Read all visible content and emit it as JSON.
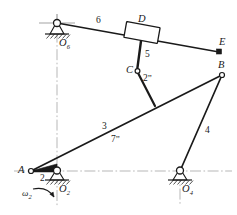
{
  "figure": {
    "type": "kinematic-linkage-diagram",
    "stroke_color": "#1a1a1a",
    "centerline_color": "#8a8a8a",
    "joint_labels": {
      "A": "A",
      "B": "B",
      "C": "C",
      "D": "D",
      "E": "E",
      "O2_letter": "O",
      "O2_sub": "2",
      "O4_letter": "O",
      "O4_sub": "4",
      "O6_letter": "O",
      "O6_sub": "6"
    },
    "link_labels": {
      "link2": "2",
      "link3": "3",
      "link4": "4",
      "link5": "5",
      "link6": "6",
      "link2pp_num": "2",
      "link2pp_prime": "”",
      "link7pp_num": "7",
      "link7pp_prime": "”"
    },
    "motion": {
      "omega_symbol": "ω",
      "omega_sub": "2",
      "sense": "clockwise"
    },
    "geometry": {
      "A": [
        31,
        171
      ],
      "O2": [
        57,
        171
      ],
      "O4": [
        180,
        171
      ],
      "O6": [
        57,
        23
      ],
      "B": [
        222,
        75
      ],
      "C": [
        137,
        71
      ],
      "D": [
        142,
        33
      ],
      "E": [
        219,
        52
      ],
      "P_on_link3": [
        155,
        106
      ],
      "ground_y": 171,
      "vertical_centerline_x": 57
    }
  }
}
